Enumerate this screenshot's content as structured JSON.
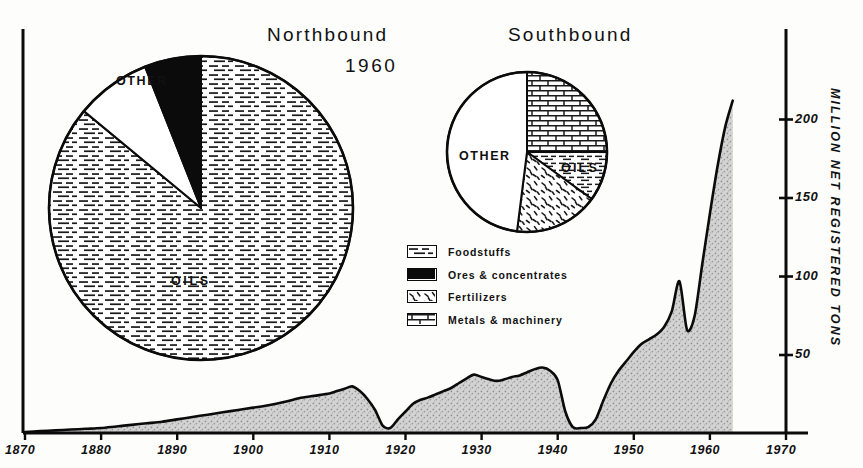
{
  "titles": {
    "northbound": "Northbound",
    "southbound": "Southbound",
    "year": "1960"
  },
  "axis": {
    "y_title": "MILLION NET REGISTERED TONS",
    "y_ticks": [
      "50",
      "100",
      "150",
      "200"
    ],
    "x_ticks": [
      "1870",
      "1880",
      "1890",
      "1900",
      "1910",
      "1920",
      "1930",
      "1940",
      "1950",
      "1960",
      "1970"
    ]
  },
  "legend": {
    "items": [
      {
        "label": "Foodstuffs",
        "pattern": "dashes"
      },
      {
        "label": "Ores & concentrates",
        "pattern": "solid-black"
      },
      {
        "label": "Fertilizers",
        "pattern": "squiggles"
      },
      {
        "label": "Metals & machinery",
        "pattern": "bricks"
      }
    ]
  },
  "pies": {
    "northbound": {
      "label_oils": "OILS",
      "label_other": "OTHER",
      "slices": [
        {
          "name": "Oils",
          "percent": 86,
          "pattern": "dashes"
        },
        {
          "name": "Other",
          "percent": 8,
          "pattern": "white"
        },
        {
          "name": "Ores & concentrates",
          "percent": 6,
          "pattern": "solid-black"
        }
      ]
    },
    "southbound": {
      "label_oils": "OILS",
      "label_other": "OTHER",
      "slices": [
        {
          "name": "Metals & machinery",
          "percent": 25,
          "pattern": "bricks"
        },
        {
          "name": "Oils",
          "percent": 10,
          "pattern": "dashes"
        },
        {
          "name": "Fertilizers",
          "percent": 17,
          "pattern": "squiggles"
        },
        {
          "name": "Other",
          "percent": 48,
          "pattern": "white"
        }
      ]
    }
  },
  "chart_data": {
    "type": "area",
    "title": "1960",
    "xlabel": "",
    "ylabel": "MILLION NET REGISTERED TONS",
    "xlim": [
      1870,
      1970
    ],
    "ylim": [
      0,
      225
    ],
    "grid": false,
    "legend_position": "center",
    "x": [
      1870,
      1872,
      1874,
      1876,
      1878,
      1880,
      1882,
      1884,
      1886,
      1888,
      1890,
      1892,
      1894,
      1896,
      1898,
      1900,
      1902,
      1904,
      1906,
      1908,
      1910,
      1911,
      1912,
      1913,
      1914,
      1915,
      1916,
      1917,
      1918,
      1919,
      1920,
      1921,
      1922,
      1923,
      1924,
      1925,
      1926,
      1927,
      1928,
      1929,
      1930,
      1931,
      1932,
      1933,
      1934,
      1935,
      1936,
      1937,
      1938,
      1939,
      1940,
      1941,
      1942,
      1943,
      1944,
      1945,
      1946,
      1947,
      1948,
      1949,
      1950,
      1951,
      1952,
      1953,
      1954,
      1955,
      1956,
      1957,
      1958,
      1959,
      1960,
      1961,
      1962,
      1963
    ],
    "y": [
      1,
      1.5,
      2,
      2.5,
      3,
      3.5,
      4.5,
      5.5,
      6.5,
      7.5,
      9,
      10.5,
      12,
      13.5,
      15,
      16.5,
      18,
      20,
      22.5,
      24,
      25.5,
      27,
      28.5,
      30,
      27,
      22,
      15,
      5,
      3.5,
      9,
      14,
      19,
      21.5,
      23,
      25,
      27,
      29,
      32,
      35,
      37.5,
      36,
      34.5,
      33.5,
      34.5,
      36,
      37,
      39,
      41,
      42,
      40,
      34,
      14,
      4,
      3.5,
      4,
      9,
      21,
      32,
      40,
      46,
      52,
      57,
      60,
      63,
      68,
      78,
      97,
      66,
      75,
      108,
      140,
      170,
      195,
      212
    ],
    "series": [
      {
        "name": "Shipping through the Suez Canal",
        "values_note": "annual net registered tons, millions"
      }
    ],
    "annotations": [
      {
        "text": "World War I trough",
        "x": 1917,
        "y": 5
      },
      {
        "text": "World War II trough",
        "x": 1942,
        "y": 4
      },
      {
        "text": "Suez crisis closure",
        "x": 1957,
        "y": 66
      }
    ]
  }
}
